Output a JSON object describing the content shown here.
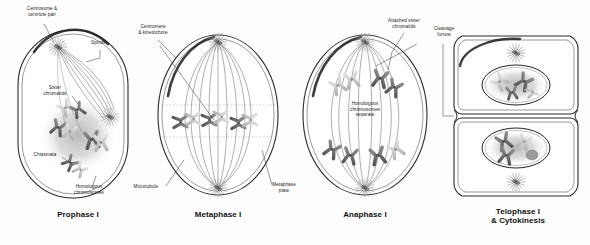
{
  "figure": {
    "kind": "meiosis-i-diagram",
    "background_color": "#fdfdfd",
    "ink_color": "#222222",
    "chromosome_dark": "#6b6b6b",
    "chromosome_light": "#c9c9c9",
    "membrane_color": "#2b2b2b"
  },
  "panels": [
    {
      "id": "prophase-1",
      "title": "Prophase I",
      "labels": [
        {
          "id": "centrosome-centriole-pair",
          "text": "Centrosome &\ncentriole pair"
        },
        {
          "id": "spindle",
          "text": "Spindle"
        },
        {
          "id": "sister-chromatids",
          "text": "Sister\nchromatids"
        },
        {
          "id": "chiasmata",
          "text": "Chiasmata"
        },
        {
          "id": "homologous-chromosomes",
          "text": "Homologous\nchromosomes"
        }
      ]
    },
    {
      "id": "metaphase-1",
      "title": "Metaphase I",
      "labels": [
        {
          "id": "centromere-kinetochore",
          "text": "Centromere\n& kinetochore"
        },
        {
          "id": "microtubule",
          "text": "Microtubule"
        },
        {
          "id": "metaphase-plate",
          "text": "Metaphase\nplate"
        }
      ]
    },
    {
      "id": "anaphase-1",
      "title": "Anaphase I",
      "labels": [
        {
          "id": "attached-sister-chromatids",
          "text": "Attached sister\nchromatids"
        },
        {
          "id": "homologous-chromosomes-separate",
          "text": "Homologous\nchromosomes\nseparate"
        }
      ]
    },
    {
      "id": "telophase-1-cytokinesis",
      "title": "Telophase I\n& Cytokinesis",
      "labels": [
        {
          "id": "cleavage-furrow",
          "text": "Cleavage\nfurrow"
        }
      ]
    }
  ]
}
